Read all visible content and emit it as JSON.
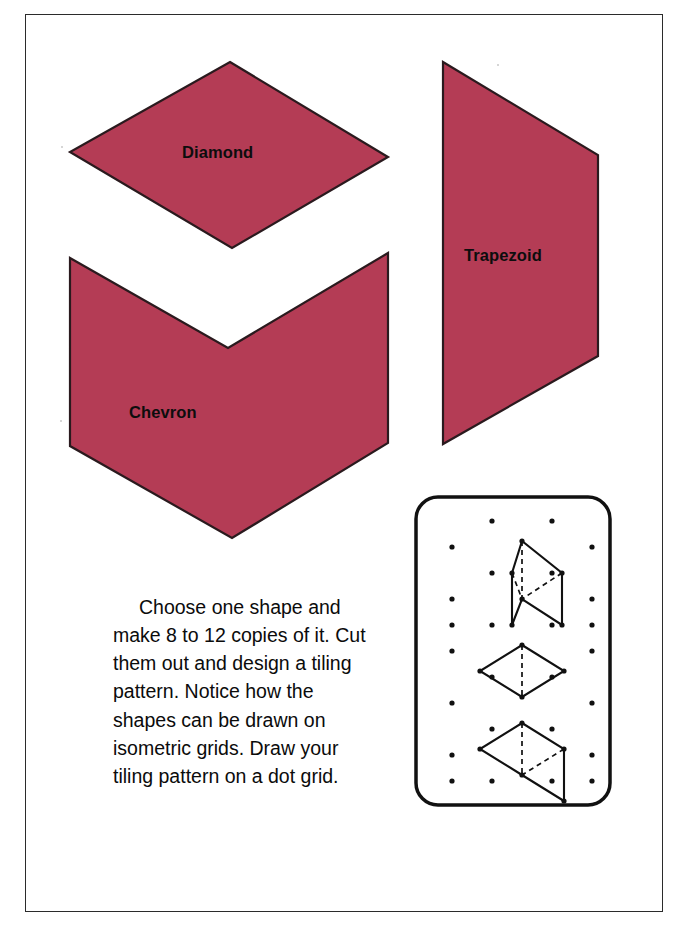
{
  "page": {
    "background_color": "#ffffff",
    "border_color": "#2b2b2b",
    "shape_fill_color": "#b43c55",
    "shape_stroke_color": "#2a1a1e",
    "ink_color": "#0b0b0b"
  },
  "shapes": [
    {
      "id": "diamond",
      "label": "Diamond",
      "kind": "rhombus",
      "points": "230,62 388,157 232,248 70,152",
      "label_position": {
        "left": 182,
        "top": 143
      }
    },
    {
      "id": "chevron",
      "label": "Chevron",
      "kind": "chevron",
      "points": "70,258 228,348 388,253 388,443 232,538 70,446",
      "label_position": {
        "left": 129,
        "top": 403
      }
    },
    {
      "id": "trapezoid",
      "label": "Trapezoid",
      "kind": "trapezoid",
      "points": "443,62 598,155 598,356 443,444",
      "label_position": {
        "left": 464,
        "top": 246
      }
    }
  ],
  "instructions": {
    "text": "Choose one shape and make 8 to 12 copies of it. Cut them out and design a tiling pattern. Notice how the shapes can be drawn on isometric grids. Draw your tiling pattern on a dot grid.",
    "lines": [
      "Choose one shape and",
      "make 8 to 12 copies of it.",
      "Cut them out and design",
      "a tiling pattern. Notice",
      "how the shapes can be",
      "drawn on isometric grids.",
      "Draw your tiling pattern",
      "on a dot grid."
    ]
  },
  "dot_grid": {
    "panel": {
      "x": 414,
      "y": 495,
      "width": 198,
      "height": 312,
      "corner_radius": 22,
      "stroke_color": "#111111",
      "stroke_width": 3.5,
      "fill": "#ffffff"
    },
    "dot_color": "#111111",
    "dot_radius": 2.6,
    "dots": [
      [
        78,
        26
      ],
      [
        138,
        26
      ],
      [
        38,
        52
      ],
      [
        178,
        52
      ],
      [
        78,
        78
      ],
      [
        138,
        78
      ],
      [
        38,
        104
      ],
      [
        178,
        104
      ],
      [
        78,
        130
      ],
      [
        138,
        130
      ],
      [
        38,
        130
      ],
      [
        178,
        130
      ],
      [
        38,
        156
      ],
      [
        178,
        156
      ],
      [
        78,
        182
      ],
      [
        138,
        182
      ],
      [
        38,
        208
      ],
      [
        178,
        208
      ],
      [
        78,
        234
      ],
      [
        138,
        234
      ],
      [
        38,
        260
      ],
      [
        178,
        260
      ],
      [
        78,
        286
      ],
      [
        138,
        286
      ],
      [
        38,
        286
      ],
      [
        178,
        286
      ]
    ],
    "figures": [
      {
        "name": "chevron-on-isometric-grid",
        "solid_path": "M 98,78 L 108,46 L 148,78 L 148,130 L 108,104 L 98,130 Z",
        "dashed_segments": [
          "M 108,46 L 108,104",
          "M 98,78 L 108,104",
          "M 148,78 L 108,104"
        ],
        "vertex_dots": [
          [
            108,
            46
          ],
          [
            98,
            78
          ],
          [
            148,
            78
          ],
          [
            108,
            104
          ],
          [
            98,
            130
          ],
          [
            148,
            130
          ]
        ]
      },
      {
        "name": "diamond-on-isometric-grid",
        "solid_path": "M 108,150 L 150,176 L 108,202 L 66,176 Z",
        "dashed_segments": [
          "M 108,150 L 108,202"
        ],
        "vertex_dots": [
          [
            108,
            150
          ],
          [
            150,
            176
          ],
          [
            108,
            202
          ],
          [
            66,
            176
          ]
        ]
      },
      {
        "name": "trapezoid-on-isometric-grid",
        "solid_path": "M 108,228 L 150,254 L 150,306 L 108,280 L 66,254 Z",
        "dashed_segments": [
          "M 108,228 L 108,280",
          "M 150,254 L 108,280"
        ],
        "vertex_dots": [
          [
            108,
            228
          ],
          [
            150,
            254
          ],
          [
            108,
            280
          ],
          [
            66,
            254
          ],
          [
            150,
            306
          ]
        ]
      }
    ]
  }
}
